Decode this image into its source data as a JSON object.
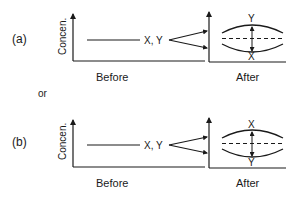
{
  "panels": [
    {
      "id": "a",
      "label": "(a)",
      "ylabel": "Concen.",
      "before_caption": "Before",
      "after_caption": "After",
      "before_curve_label": "X, Y",
      "after_top_label": "Y",
      "after_bottom_label": "X"
    },
    {
      "id": "b",
      "label": "(b)",
      "ylabel": "Concen.",
      "before_caption": "Before",
      "after_caption": "After",
      "before_curve_label": "X, Y",
      "after_top_label": "X",
      "after_bottom_label": "Y"
    }
  ],
  "separator": "or",
  "colors": {
    "ink": "#1a1a1a",
    "background": "#ffffff"
  }
}
